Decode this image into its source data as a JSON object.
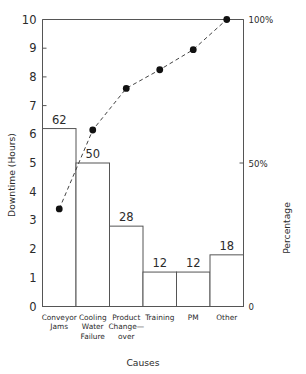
{
  "chart_data": {
    "type": "bar",
    "title": "",
    "subtitle": "",
    "xlabel": "Causes",
    "ylabel": "Downtime (Hours)",
    "y2label": "Percentage",
    "categories": [
      "Conveyor\nJams",
      "Cooling\nWater\nFailure",
      "Product\nChange-\nover",
      "Training",
      "PM",
      "Other"
    ],
    "category_lines": [
      [
        "Conveyor",
        "Jams"
      ],
      [
        "Cooling",
        "Water",
        "Failure"
      ],
      [
        "Product",
        "Change—",
        "over"
      ],
      [
        "Training"
      ],
      [
        "PM"
      ],
      [
        "Other"
      ]
    ],
    "values": [
      6.2,
      5.0,
      2.8,
      1.2,
      1.2,
      1.8
    ],
    "bar_labels": [
      "62",
      "50",
      "28",
      "12",
      "12",
      "18"
    ],
    "counts": [
      62,
      50,
      28,
      12,
      12,
      18
    ],
    "total_count": 182,
    "cumulative_percent": [
      34,
      61.5,
      76,
      82.5,
      89.5,
      100
    ],
    "series": [
      {
        "name": "Downtime (Hours)",
        "type": "bar",
        "values": [
          6.2,
          5.0,
          2.8,
          1.2,
          1.2,
          1.8
        ]
      },
      {
        "name": "Cumulative Percentage",
        "type": "line",
        "values": [
          34,
          61.5,
          76,
          82.5,
          89.5,
          100
        ]
      }
    ],
    "ylim": [
      0,
      10
    ],
    "yticks": [
      0,
      1,
      2,
      3,
      4,
      5,
      6,
      7,
      8,
      9,
      10
    ],
    "ytick_labels": [
      "0",
      "1",
      "2",
      "3",
      "4",
      "5",
      "6",
      "7",
      "8",
      "9",
      "10"
    ],
    "y2lim": [
      0,
      100
    ],
    "y2ticks": [
      0,
      50,
      100
    ],
    "y2tick_labels": [
      "0",
      "50%",
      "100%"
    ],
    "grid": false,
    "legend": "none",
    "line_style": "dashed",
    "marker": "filled-circle",
    "colors": {
      "bar_fill": "#ffffff",
      "bar_stroke": "#555555",
      "line": "#444444",
      "marker": "#111111",
      "axis": "#555555",
      "text": "#2b2b2b",
      "background": "#ffffff"
    }
  }
}
